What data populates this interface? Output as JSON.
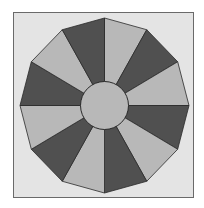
{
  "diagram": {
    "type": "dodecagon-with-center-circle",
    "sides": 12,
    "segments": 12,
    "center": [
      104.5,
      105.5
    ],
    "radius_x": 84.5,
    "radius_y": 87.5,
    "circle_radius": 24,
    "start_angle_deg": 90,
    "segment_colors": [
      "light",
      "dark",
      "light",
      "dark",
      "light",
      "dark",
      "light",
      "dark",
      "light",
      "dark",
      "light",
      "dark"
    ],
    "colors": {
      "dark": "#505050",
      "light": "#b8b8b8",
      "circle": "#b8b8b8",
      "background": "#e4e4e4",
      "frame_border": "#6a6a6a",
      "stroke": "#2a2a2a"
    }
  }
}
